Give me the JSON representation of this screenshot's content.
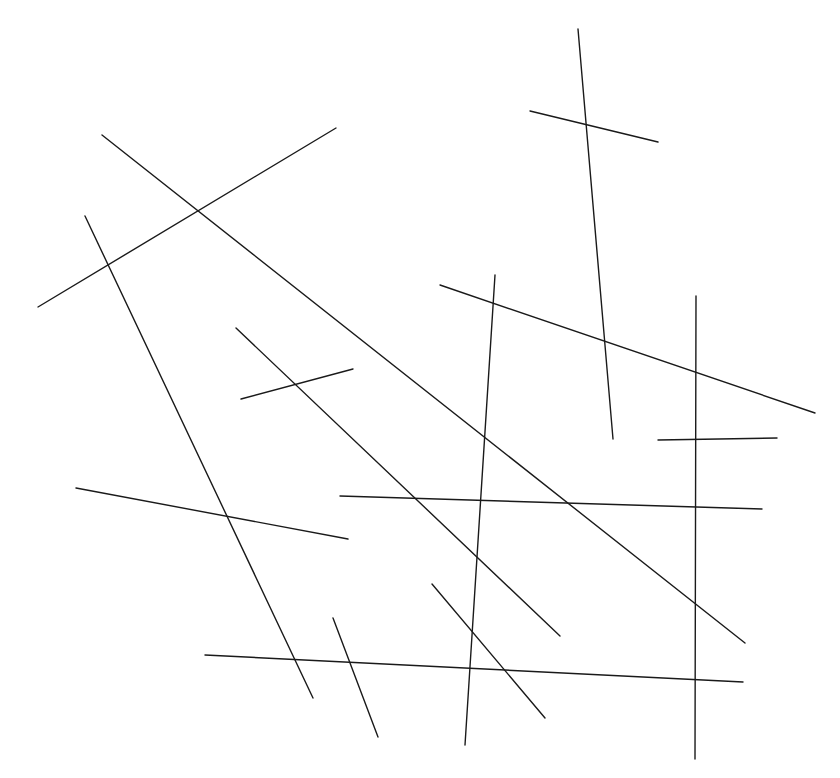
{
  "diagram": {
    "type": "line-segments",
    "background": "#ffffff",
    "stroke_color": "#1a1a1a",
    "segment_count": 16,
    "segments": [
      {
        "id": "seg-1",
        "x1": 102,
        "y1": 135,
        "x2": 745,
        "y2": 643
      },
      {
        "id": "seg-2",
        "x1": 38,
        "y1": 307,
        "x2": 336,
        "y2": 128
      },
      {
        "id": "seg-3",
        "x1": 85,
        "y1": 216,
        "x2": 313,
        "y2": 698
      },
      {
        "id": "seg-4",
        "x1": 236,
        "y1": 328,
        "x2": 560,
        "y2": 636
      },
      {
        "id": "seg-5",
        "x1": 241,
        "y1": 399,
        "x2": 353,
        "y2": 369
      },
      {
        "id": "seg-6",
        "x1": 578,
        "y1": 29,
        "x2": 613,
        "y2": 439
      },
      {
        "id": "seg-7",
        "x1": 530,
        "y1": 111,
        "x2": 658,
        "y2": 142
      },
      {
        "id": "seg-8",
        "x1": 440,
        "y1": 285,
        "x2": 815,
        "y2": 413
      },
      {
        "id": "seg-9",
        "x1": 495,
        "y1": 275,
        "x2": 465,
        "y2": 745
      },
      {
        "id": "seg-10",
        "x1": 696,
        "y1": 296,
        "x2": 695,
        "y2": 759
      },
      {
        "id": "seg-11",
        "x1": 76,
        "y1": 488,
        "x2": 348,
        "y2": 539
      },
      {
        "id": "seg-12",
        "x1": 205,
        "y1": 655,
        "x2": 743,
        "y2": 682
      },
      {
        "id": "seg-13",
        "x1": 333,
        "y1": 618,
        "x2": 378,
        "y2": 737
      },
      {
        "id": "seg-14",
        "x1": 340,
        "y1": 496,
        "x2": 762,
        "y2": 509
      },
      {
        "id": "seg-15",
        "x1": 658,
        "y1": 440,
        "x2": 777,
        "y2": 438
      },
      {
        "id": "seg-16",
        "x1": 432,
        "y1": 584,
        "x2": 545,
        "y2": 718
      }
    ]
  }
}
